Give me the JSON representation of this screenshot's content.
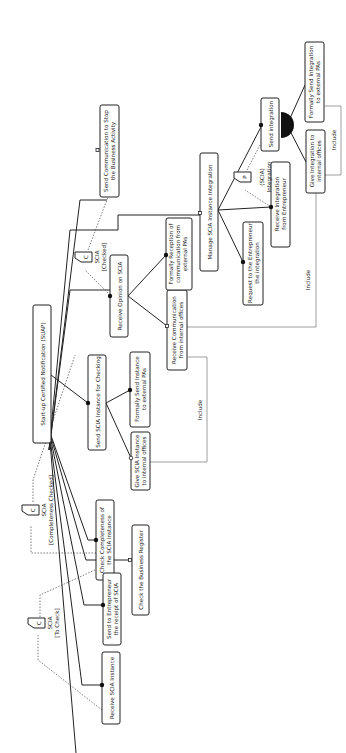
{
  "diagram": {
    "type": "goal / feature model (rotated 90°)",
    "root": {
      "id": "root",
      "label": "Start-up Certified Notification (SUAP)"
    },
    "nodes": [
      {
        "id": "receive_opinion",
        "label": [
          "Receive Opinion on SCIA"
        ]
      },
      {
        "id": "send_checking",
        "label": [
          "Send SCIA Instance for Checking"
        ]
      },
      {
        "id": "formally_send_instance",
        "label": [
          "Formally Send Instance",
          "to external PAs"
        ]
      },
      {
        "id": "give_scia_internal",
        "label": [
          "Give SCIA Instance",
          "to internal offices"
        ]
      },
      {
        "id": "receive_comm_internal",
        "label": [
          "Receive Communication",
          "from internal offices"
        ]
      },
      {
        "id": "formally_reception",
        "label": [
          "Formally Reception of",
          "communication from",
          "external PAs"
        ]
      },
      {
        "id": "manage_integration",
        "label": [
          "Manage SCIA Instance Integration"
        ]
      },
      {
        "id": "request_integration",
        "label": [
          "Request to the Entrepreneur",
          "the integration"
        ]
      },
      {
        "id": "receive_integration",
        "label": [
          "Receive Integration",
          "from Entrepreneur"
        ]
      },
      {
        "id": "send_integration",
        "label": [
          "Send integration"
        ]
      },
      {
        "id": "formally_send_integration",
        "label": [
          "Formally Send Integration",
          "to external PAs"
        ]
      },
      {
        "id": "give_integration_internal",
        "label": [
          "Give Integration to",
          "internal offices"
        ]
      },
      {
        "id": "send_stop",
        "label": [
          "Send Communication to Stop",
          "the Business Activity"
        ]
      },
      {
        "id": "check_completeness",
        "label": [
          "Check Completeness of",
          "the SCIA instance"
        ]
      },
      {
        "id": "check_register",
        "label": [
          "Check the Business Register"
        ]
      },
      {
        "id": "send_receipt",
        "label": [
          "Send to Entrepreneur",
          "the receipt of SCIA"
        ]
      },
      {
        "id": "receive_instance",
        "label": [
          "Receive SCIA Instance"
        ]
      }
    ],
    "artifacts": [
      {
        "id": "scia_to_check",
        "glyph": "C",
        "label": [
          "SCIA",
          "[To Check]"
        ]
      },
      {
        "id": "scia_completeness",
        "glyph": "C",
        "label": [
          "SCIA",
          "[Completeness Checked]"
        ]
      },
      {
        "id": "scia_checked",
        "glyph": "C",
        "label": [
          "SCIA",
          "[Checked]"
        ]
      },
      {
        "id": "scia_integration",
        "glyph": "P",
        "label": [
          "(SCIA)",
          "Integration"
        ]
      }
    ],
    "relations": {
      "include_label": "Include",
      "include_count": 3
    }
  }
}
